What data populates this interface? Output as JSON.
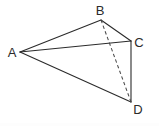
{
  "figure": {
    "type": "geometry-diagram",
    "canvas": {
      "width": 159,
      "height": 126,
      "background": "#ffffff"
    },
    "stroke_color": "#2b2b2b",
    "dashed_stroke_color": "#4a4a4a",
    "label_color": "#2b2b2b",
    "vertices": [
      {
        "id": "A",
        "label": "A",
        "x": 20,
        "y": 52,
        "label_x": 8,
        "label_y": 57
      },
      {
        "id": "B",
        "label": "B",
        "x": 101,
        "y": 20,
        "label_x": 95,
        "label_y": 15
      },
      {
        "id": "C",
        "label": "C",
        "x": 131,
        "y": 41,
        "label_x": 134,
        "label_y": 47
      },
      {
        "id": "D",
        "label": "D",
        "x": 131,
        "y": 102,
        "label_x": 133,
        "label_y": 114
      }
    ],
    "edges": [
      {
        "id": "AB",
        "from": "A",
        "to": "B",
        "style": "solid",
        "d": "M 20 52 L 101 20"
      },
      {
        "id": "AC",
        "from": "A",
        "to": "C",
        "style": "solid",
        "d": "M 20 52 L 131 41"
      },
      {
        "id": "AD",
        "from": "A",
        "to": "D",
        "style": "solid",
        "d": "M 20 52 L 131 102"
      },
      {
        "id": "BC",
        "from": "B",
        "to": "C",
        "style": "solid",
        "d": "M 101 20 L 131 41"
      },
      {
        "id": "CD",
        "from": "C",
        "to": "D",
        "style": "solid",
        "d": "M 131 41 L 131 102"
      },
      {
        "id": "BD",
        "from": "B",
        "to": "D",
        "style": "dashed",
        "d": "M 101 20 L 131 102"
      }
    ]
  }
}
